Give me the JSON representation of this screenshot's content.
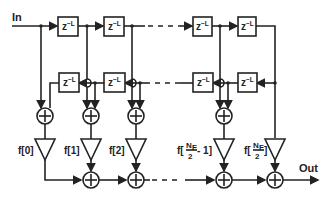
{
  "diagram": {
    "type": "folded FIR filter block diagram",
    "input_label": "In",
    "output_label": "Out",
    "delay_label": "z",
    "delay_exponent": "−L",
    "top_delays": 4,
    "bottom_delays": 4,
    "taps": [
      {
        "label": "f[0]"
      },
      {
        "label": "f[1]"
      },
      {
        "label": "f[2]"
      },
      {
        "label_prefix": "f[",
        "numerator": "N",
        "numerator_sub": "F",
        "denominator": "2",
        "label_suffix": " - 1]"
      },
      {
        "label_prefix": "f[",
        "numerator": "N",
        "numerator_sub": "F",
        "denominator": "2",
        "label_suffix": "]"
      }
    ],
    "color": "#222222"
  }
}
